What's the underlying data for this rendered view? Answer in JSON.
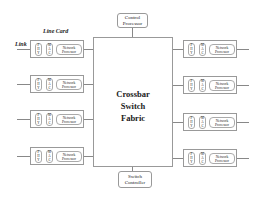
{
  "diagram": {
    "type": "router-architecture",
    "labels": {
      "link": "Link",
      "line_card": "Line Card"
    },
    "crossbar": {
      "lines": [
        "Crossbar",
        "Switch",
        "Fabric"
      ]
    },
    "control_processor": {
      "lines": [
        "Control",
        "Processor"
      ]
    },
    "switch_controller": {
      "lines": [
        "Switch",
        "Controller"
      ]
    },
    "line_card": {
      "phy": [
        "P",
        "H",
        "Y"
      ],
      "mac": [
        "M",
        "A",
        "C"
      ],
      "network_processor": [
        "Network",
        "Processor"
      ]
    },
    "left_cards_count": 4,
    "right_cards_count": 4
  }
}
